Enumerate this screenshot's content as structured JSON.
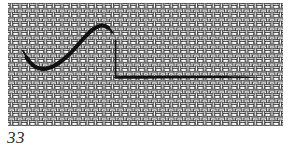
{
  "figure": {
    "number": "33",
    "colors": {
      "background": "#ffffff",
      "weave_outline": "#2e2e2e",
      "weave_fill": "#ffffff",
      "weave_gap": "#ededed",
      "thread": "#111111",
      "label": "#2f2f2f"
    },
    "elements": {
      "fabric": "woven-canvas-texture",
      "thread_curve": "curved-thread-stitch",
      "vertical_line": "needle-down-line",
      "horizontal_line": "laid-thread-line"
    }
  }
}
